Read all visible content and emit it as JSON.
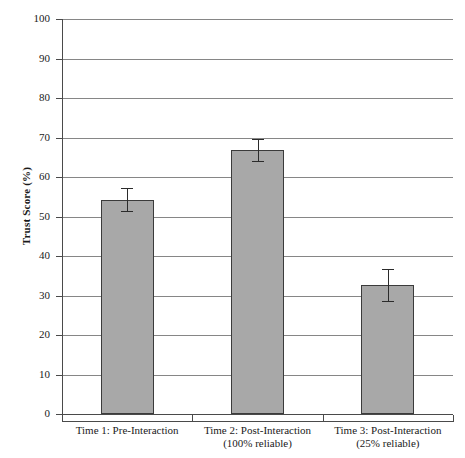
{
  "chart_data": {
    "type": "bar",
    "title": "",
    "xlabel": "",
    "ylabel": "Trust Score (%)",
    "ylim": [
      0,
      100
    ],
    "ytick_step": 10,
    "yticks": [
      100,
      90,
      80,
      70,
      60,
      50,
      40,
      30,
      20,
      10,
      0
    ],
    "ytick_labels": [
      "100",
      "90",
      "80",
      "70",
      "60",
      "50",
      "40",
      "30",
      "20",
      "10",
      "0"
    ],
    "grid": true,
    "grid_axis": "y",
    "legend": null,
    "legend_position": "none",
    "bar_color": "#a8a8a8",
    "bar_edge_color": "#3b3b3b",
    "error_color": "#2b2b2b",
    "categories": [
      "Time 1: Pre-Interaction",
      "Time 2: Post-Interaction",
      "Time 3: Post-Interaction"
    ],
    "category_sublabels": [
      "",
      "(100% reliable)",
      "(25% reliable)"
    ],
    "values": [
      54.3,
      66.8,
      32.6
    ],
    "errors": [
      3.0,
      2.8,
      4.0
    ],
    "bars": [
      {
        "label_line1": "Time 1: Pre-Interaction",
        "label_line2": "",
        "value": 54.3,
        "error": 3.0,
        "error_upper": 57.3,
        "error_lower": 51.3
      },
      {
        "label_line1": "Time 2: Post-Interaction",
        "label_line2": "(100% reliable)",
        "value": 66.8,
        "error": 2.8,
        "error_upper": 69.6,
        "error_lower": 64.0
      },
      {
        "label_line1": "Time 3: Post-Interaction",
        "label_line2": "(25% reliable)",
        "value": 32.6,
        "error": 4.0,
        "error_upper": 36.6,
        "error_lower": 28.6
      }
    ]
  }
}
